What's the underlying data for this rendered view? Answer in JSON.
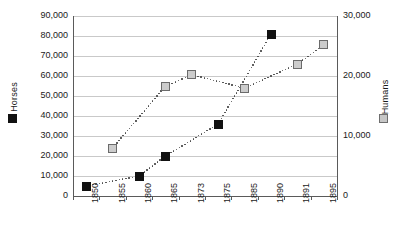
{
  "chart_data": {
    "type": "scatter",
    "title": "",
    "xlabel": "",
    "categories": [
      "1850",
      "1855",
      "1860",
      "1865",
      "1873",
      "1875",
      "1885",
      "1890",
      "1891",
      "1895"
    ],
    "grid": true,
    "legend_position": "axis-labels",
    "axes": {
      "left": {
        "label": "Horses",
        "ylim": [
          0,
          90000
        ],
        "ticks": [
          0,
          10000,
          20000,
          30000,
          40000,
          50000,
          60000,
          70000,
          80000,
          90000
        ],
        "tick_labels": [
          "0",
          "10,000",
          "20,000",
          "30,000",
          "40,000",
          "50,000",
          "60,000",
          "70,000",
          "80,000",
          "90,000"
        ]
      },
      "right": {
        "label": "Humans",
        "ylim": [
          0,
          30000
        ],
        "ticks": [
          0,
          10000,
          20000,
          30000
        ],
        "tick_labels": [
          "0",
          "10,000",
          "20,000",
          "30,000"
        ]
      }
    },
    "series": [
      {
        "name": "Horses",
        "axis": "left",
        "marker": "filled-square",
        "color": "#111111",
        "points": [
          {
            "x": "1850",
            "y": 5000
          },
          {
            "x": "1860",
            "y": 10000
          },
          {
            "x": "1865",
            "y": 20000
          },
          {
            "x": "1875",
            "y": 36000
          },
          {
            "x": "1890",
            "y": 81000
          }
        ]
      },
      {
        "name": "Humans",
        "axis": "right",
        "marker": "open-square",
        "color": "#cccccc",
        "points": [
          {
            "x": "1855",
            "y": 8000
          },
          {
            "x": "1865",
            "y": 18300
          },
          {
            "x": "1873",
            "y": 20200
          },
          {
            "x": "1885",
            "y": 18000
          },
          {
            "x": "1891",
            "y": 22000
          },
          {
            "x": "1895",
            "y": 25200
          }
        ]
      }
    ]
  },
  "legend": {
    "horses_symbol": "filled-square-icon",
    "humans_symbol": "open-square-icon"
  }
}
